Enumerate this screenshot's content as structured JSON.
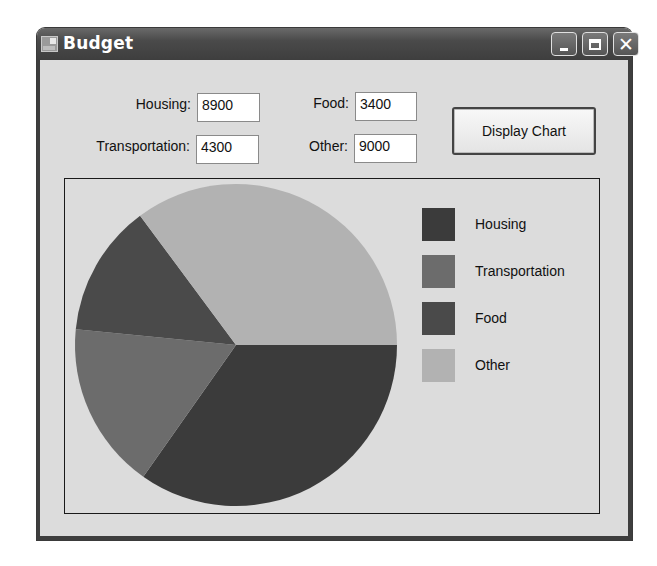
{
  "window": {
    "title": "Budget",
    "icon": "app-form-icon",
    "controls": {
      "minimize": "minimize-icon",
      "maximize": "maximize-icon",
      "close": "close-icon",
      "close_glyph": "✕"
    }
  },
  "form": {
    "housing": {
      "label": "Housing:",
      "value": "8900"
    },
    "transportation": {
      "label": "Transportation:",
      "value": "4300"
    },
    "food": {
      "label": "Food:",
      "value": "3400"
    },
    "other": {
      "label": "Other:",
      "value": "9000"
    },
    "display_button": "Display Chart"
  },
  "legend": [
    {
      "label": "Housing",
      "color": "#3b3b3b"
    },
    {
      "label": "Transportation",
      "color": "#6c6c6c"
    },
    {
      "label": "Food",
      "color": "#4a4a4a"
    },
    {
      "label": "Other",
      "color": "#b2b2b2"
    }
  ],
  "chart_data": {
    "type": "pie",
    "title": "",
    "categories": [
      "Housing",
      "Transportation",
      "Food",
      "Other"
    ],
    "values": [
      8900,
      4300,
      3400,
      9000
    ],
    "colors": [
      "#3b3b3b",
      "#6c6c6c",
      "#4a4a4a",
      "#b2b2b2"
    ],
    "start_angle_deg": 0,
    "direction": "clockwise",
    "legend_position": "right"
  }
}
